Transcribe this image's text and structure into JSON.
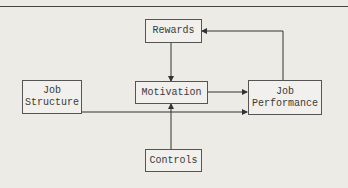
{
  "diagram": {
    "nodes": {
      "rewards": {
        "label": "Rewards"
      },
      "motivation": {
        "label": "Motivation"
      },
      "job_structure": {
        "line1": "Job",
        "line2": "Structure"
      },
      "job_performance": {
        "line1": "Job",
        "line2": "Performance"
      },
      "controls": {
        "label": "Controls"
      }
    },
    "edges": [
      {
        "from": "Rewards",
        "to": "Motivation"
      },
      {
        "from": "Controls",
        "to": "Motivation"
      },
      {
        "from": "Motivation",
        "to": "Job Performance"
      },
      {
        "from": "Job Structure",
        "to": "Job Performance"
      },
      {
        "from": "Job Performance",
        "to": "Rewards"
      }
    ]
  }
}
